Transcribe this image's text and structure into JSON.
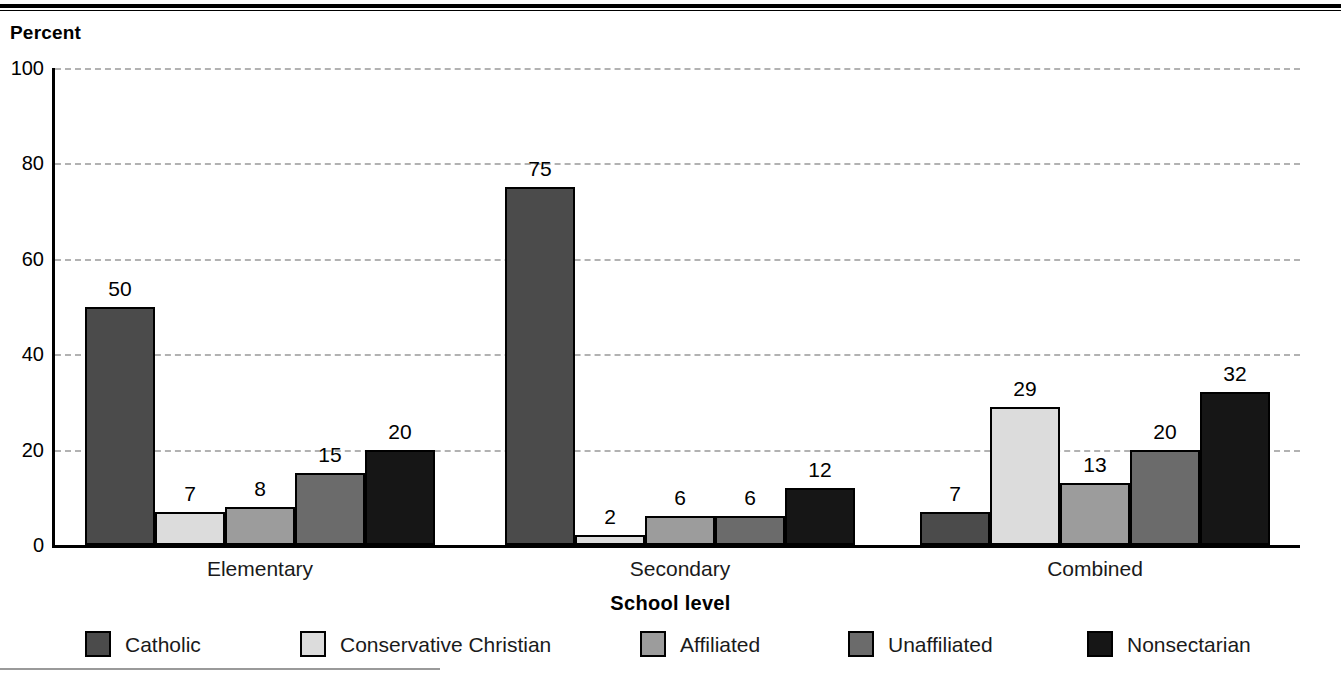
{
  "chart_data": {
    "type": "bar",
    "title": "",
    "xlabel": "School level",
    "ylabel": "Percent",
    "ylim": [
      0,
      100
    ],
    "yticks": [
      0,
      20,
      40,
      60,
      80,
      100
    ],
    "grid": true,
    "legend_position": "bottom",
    "categories": [
      "Elementary",
      "Secondary",
      "Combined"
    ],
    "series": [
      {
        "name": "Catholic",
        "color": "#4b4b4b",
        "values": [
          50,
          75,
          7
        ]
      },
      {
        "name": "Conservative Christian",
        "color": "#dcdcdc",
        "values": [
          7,
          2,
          29
        ]
      },
      {
        "name": "Affiliated",
        "color": "#9c9c9c",
        "values": [
          8,
          6,
          13
        ]
      },
      {
        "name": "Unaffiliated",
        "color": "#6b6b6b",
        "values": [
          15,
          6,
          20
        ]
      },
      {
        "name": "Nonsectarian",
        "color": "#161616",
        "values": [
          20,
          12,
          32
        ]
      }
    ]
  },
  "axis": {
    "y_title": "Percent",
    "x_title": "School level",
    "tick_labels": [
      "100",
      "80",
      "60",
      "40",
      "20",
      "0"
    ]
  },
  "groups": [
    {
      "label": "Elementary"
    },
    {
      "label": "Secondary"
    },
    {
      "label": "Combined"
    }
  ],
  "legend": {
    "items": [
      {
        "label": "Catholic",
        "color": "#4b4b4b"
      },
      {
        "label": "Conservative Christian",
        "color": "#dcdcdc"
      },
      {
        "label": "Affiliated",
        "color": "#9c9c9c"
      },
      {
        "label": "Unaffiliated",
        "color": "#6b6b6b"
      },
      {
        "label": "Nonsectarian",
        "color": "#161616"
      }
    ]
  },
  "bar_labels": {
    "elementary": [
      "50",
      "7",
      "8",
      "15",
      "20"
    ],
    "secondary": [
      "75",
      "2",
      "6",
      "6",
      "12"
    ],
    "combined": [
      "7",
      "29",
      "13",
      "20",
      "32"
    ]
  }
}
